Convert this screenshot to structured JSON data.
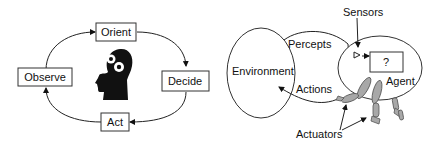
{
  "ooda": {
    "nodes": {
      "orient": "Orient",
      "decide": "Decide",
      "act": "Act",
      "observe": "Observe"
    },
    "center_icon": "head-with-gears-icon"
  },
  "agent_diagram": {
    "environment": "Environment",
    "percepts": "Percepts",
    "actions": "Actions",
    "sensors": "Sensors",
    "agent": "Agent",
    "unknown": "?",
    "actuators": "Actuators"
  },
  "colors": {
    "stroke": "#222222",
    "limb_fill": "#a8a8a8",
    "head_fill": "#111111"
  }
}
